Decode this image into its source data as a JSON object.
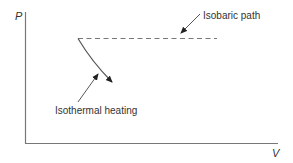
{
  "diagram": {
    "type": "P-V diagram",
    "axes": {
      "y_label": "P",
      "x_label": "V"
    },
    "annotations": {
      "isobaric": "Isobaric path",
      "isothermal": "Isothermal heating"
    },
    "colors": {
      "axis": "#777777",
      "curve": "#555555",
      "text": "#333333",
      "arrow": "#222222"
    }
  }
}
